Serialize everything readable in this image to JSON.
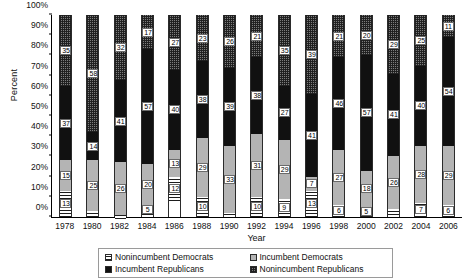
{
  "chart_data": {
    "type": "bar",
    "stacked": true,
    "stack_mode": "percent",
    "title": "",
    "xlabel": "Year",
    "ylabel": "Percent",
    "ylim": [
      0,
      100
    ],
    "yticks": [
      "0%",
      "10%",
      "20%",
      "30%",
      "40%",
      "50%",
      "60%",
      "70%",
      "80%",
      "90%",
      "100%"
    ],
    "ytick_values": [
      0,
      10,
      20,
      30,
      40,
      50,
      60,
      70,
      80,
      90,
      100
    ],
    "grid": false,
    "legend_position": "bottom",
    "categories": [
      "1978",
      "1980",
      "1982",
      "1984",
      "1986",
      "1988",
      "1990",
      "1992",
      "1994",
      "1996",
      "1998",
      "2000",
      "2002",
      "2004",
      "2006"
    ],
    "series": [
      {
        "name": "Nonincumbent Democrats",
        "pattern": "horizontal-hatch",
        "color": "#ffffff",
        "values": [
          13,
          3,
          2,
          5,
          12,
          10,
          1,
          10,
          9,
          13,
          6,
          5,
          3,
          7,
          6
        ]
      },
      {
        "name": "Incumbent Democrats",
        "pattern": "light-gray",
        "color": "#b4b4b4",
        "values": [
          15,
          25,
          26,
          20,
          13,
          29,
          33,
          31,
          29,
          7,
          27,
          18,
          26,
          28,
          29
        ]
      },
      {
        "name": "Incumbent Republicans",
        "pattern": "solid-black",
        "color": "#111111",
        "values": [
          37,
          14,
          41,
          57,
          40,
          38,
          39,
          38,
          27,
          41,
          46,
          57,
          41,
          40,
          54
        ]
      },
      {
        "name": "Nonincumbent Republicans",
        "pattern": "dark-checker",
        "color": "#7d7d7d",
        "values": [
          35,
          58,
          32,
          17,
          27,
          23,
          26,
          21,
          35,
          39,
          21,
          20,
          29,
          25,
          11
        ]
      }
    ]
  },
  "legend": {
    "items": [
      {
        "label": "Nonincumbent Democrats",
        "key": "nid"
      },
      {
        "label": "Incumbent Democrats",
        "key": "id"
      },
      {
        "label": "Incumbent Republicans",
        "key": "ir"
      },
      {
        "label": "Nonincumbent Republicans",
        "key": "nir"
      }
    ]
  }
}
